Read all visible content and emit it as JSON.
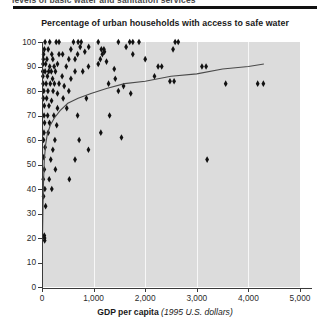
{
  "figure": {
    "top_caption": "levels of basic water and sanitation services",
    "title": "Percentage of urban households with access to safe water",
    "x_axis_title_bold": "GDP per capita",
    "x_axis_title_italic": "(1995 U.S. dollars)",
    "plot_background": "#dcdcdc",
    "gridline_color": "#f7f7f7",
    "marker_color": "#111111",
    "trend_color": "#4a4a4a"
  },
  "chart_data": {
    "type": "scatter",
    "title": "Percentage of urban households with access to safe water",
    "xlabel": "GDP per capita (1995 U.S. dollars)",
    "ylabel": "",
    "xlim": [
      0,
      5000
    ],
    "ylim": [
      0,
      100
    ],
    "xticks": [
      0,
      1000,
      2000,
      3000,
      4000,
      5000
    ],
    "xticklabels": [
      "0",
      "1,000",
      "2,000",
      "3,000",
      "4,000",
      "5,000"
    ],
    "yticks": [
      0,
      10,
      20,
      30,
      40,
      50,
      60,
      70,
      80,
      90,
      100
    ],
    "yticklabels": [
      "0",
      "10",
      "20",
      "30",
      "40",
      "50",
      "60",
      "70",
      "80",
      "90",
      "100"
    ],
    "grid": "vertical-only",
    "legend": "none",
    "series": [
      {
        "name": "Urban households with access to safe water",
        "marker": "diamond",
        "points": [
          [
            60,
            100
          ],
          [
            150,
            100
          ],
          [
            275,
            100
          ],
          [
            330,
            100
          ],
          [
            610,
            100
          ],
          [
            700,
            100
          ],
          [
            760,
            100
          ],
          [
            1090,
            100
          ],
          [
            1480,
            100
          ],
          [
            1700,
            100
          ],
          [
            1760,
            100
          ],
          [
            1880,
            100
          ],
          [
            2580,
            100
          ],
          [
            2640,
            100
          ],
          [
            45,
            97
          ],
          [
            120,
            97
          ],
          [
            560,
            97
          ],
          [
            740,
            98
          ],
          [
            905,
            98
          ],
          [
            1150,
            97
          ],
          [
            1200,
            97
          ],
          [
            1630,
            98
          ],
          [
            2540,
            97
          ],
          [
            30,
            95
          ],
          [
            190,
            95
          ],
          [
            330,
            95
          ],
          [
            400,
            95
          ],
          [
            690,
            95
          ],
          [
            830,
            96
          ],
          [
            1170,
            95
          ],
          [
            1210,
            96
          ],
          [
            1760,
            95
          ],
          [
            25,
            93
          ],
          [
            95,
            93
          ],
          [
            210,
            93
          ],
          [
            520,
            93
          ],
          [
            640,
            93
          ],
          [
            1130,
            93
          ],
          [
            1250,
            92
          ],
          [
            2000,
            93
          ],
          [
            20,
            91
          ],
          [
            70,
            91
          ],
          [
            150,
            90
          ],
          [
            235,
            90
          ],
          [
            300,
            91
          ],
          [
            470,
            90
          ],
          [
            900,
            90
          ],
          [
            1090,
            91
          ],
          [
            15,
            88
          ],
          [
            60,
            88
          ],
          [
            130,
            88
          ],
          [
            180,
            88
          ],
          [
            260,
            88
          ],
          [
            640,
            88
          ],
          [
            790,
            88
          ],
          [
            1400,
            89
          ],
          [
            2250,
            90
          ],
          [
            2320,
            90
          ],
          [
            3100,
            90
          ],
          [
            3180,
            90
          ],
          [
            18,
            86
          ],
          [
            105,
            86
          ],
          [
            205,
            85
          ],
          [
            390,
            86
          ],
          [
            560,
            85
          ],
          [
            1420,
            85
          ],
          [
            2180,
            86
          ],
          [
            22,
            83
          ],
          [
            80,
            83
          ],
          [
            160,
            83
          ],
          [
            240,
            83
          ],
          [
            330,
            83
          ],
          [
            430,
            82
          ],
          [
            1290,
            83
          ],
          [
            1580,
            82
          ],
          [
            2480,
            84
          ],
          [
            2560,
            84
          ],
          [
            3560,
            83
          ],
          [
            4180,
            83
          ],
          [
            4290,
            83
          ],
          [
            35,
            80
          ],
          [
            115,
            80
          ],
          [
            215,
            80
          ],
          [
            300,
            79
          ],
          [
            520,
            80
          ],
          [
            1480,
            80
          ],
          [
            1720,
            79
          ],
          [
            25,
            77
          ],
          [
            90,
            77
          ],
          [
            185,
            76
          ],
          [
            410,
            77
          ],
          [
            860,
            77
          ],
          [
            45,
            74
          ],
          [
            135,
            74
          ],
          [
            300,
            73
          ],
          [
            480,
            73
          ],
          [
            40,
            70
          ],
          [
            110,
            70
          ],
          [
            230,
            70
          ],
          [
            690,
            70
          ],
          [
            1310,
            70
          ],
          [
            50,
            67
          ],
          [
            145,
            67
          ],
          [
            285,
            66
          ],
          [
            38,
            63
          ],
          [
            120,
            63
          ],
          [
            1140,
            63
          ],
          [
            30,
            60
          ],
          [
            250,
            60
          ],
          [
            720,
            60
          ],
          [
            1540,
            61
          ],
          [
            60,
            57
          ],
          [
            210,
            56
          ],
          [
            900,
            56
          ],
          [
            35,
            53
          ],
          [
            170,
            52
          ],
          [
            640,
            52
          ],
          [
            3200,
            52
          ],
          [
            45,
            48
          ],
          [
            260,
            48
          ],
          [
            25,
            44
          ],
          [
            140,
            44
          ],
          [
            530,
            44
          ],
          [
            55,
            40
          ],
          [
            190,
            40
          ],
          [
            30,
            37
          ],
          [
            70,
            33
          ],
          [
            45,
            21
          ],
          [
            50,
            20
          ],
          [
            52,
            19
          ]
        ]
      }
    ],
    "trend_line": {
      "name": "fitted logarithmic trend",
      "points": [
        [
          10,
          21
        ],
        [
          25,
          40
        ],
        [
          45,
          52
        ],
        [
          70,
          58
        ],
        [
          100,
          62
        ],
        [
          160,
          66
        ],
        [
          240,
          69
        ],
        [
          350,
          72
        ],
        [
          500,
          75
        ],
        [
          700,
          77
        ],
        [
          950,
          79
        ],
        [
          1250,
          81
        ],
        [
          1600,
          83
        ],
        [
          2000,
          84
        ],
        [
          2500,
          86
        ],
        [
          3000,
          87
        ],
        [
          3500,
          89
        ],
        [
          4000,
          90
        ],
        [
          4300,
          91
        ]
      ]
    }
  }
}
